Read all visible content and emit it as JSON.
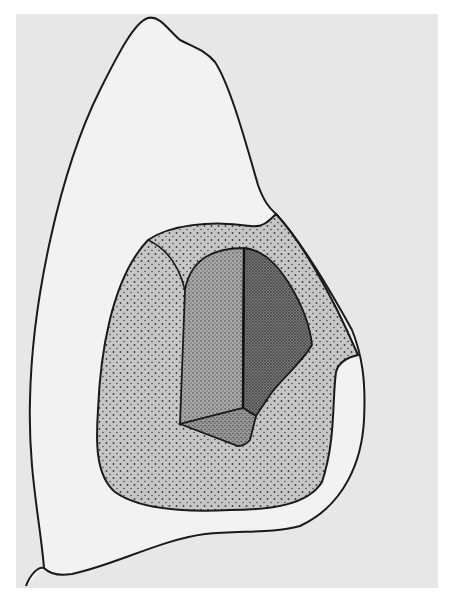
{
  "figure": {
    "title": "Tooth outline with cavity preparation",
    "colors": {
      "page": "#ffffff",
      "panel": "#e7e7e7",
      "tooth": "#f0f0f0",
      "outline": "#1a1a1a",
      "outer_preparation": "#c4c4c4",
      "cavity_wall_light": "#9a9a9a",
      "cavity_wall_dark": "#6a6a6a",
      "cavity_floor": "#8a8a8a",
      "stipple": "#444444"
    },
    "regions": [
      {
        "id": "tooth-outline",
        "label": "Tooth crown outline"
      },
      {
        "id": "outer-preparation",
        "label": "Outer stippled preparation area"
      },
      {
        "id": "cavity-left-wall",
        "label": "Cavity left wall (medium stipple)"
      },
      {
        "id": "cavity-right-wall",
        "label": "Cavity right wall (dense stipple)"
      },
      {
        "id": "cavity-floor",
        "label": "Cavity floor"
      }
    ]
  }
}
